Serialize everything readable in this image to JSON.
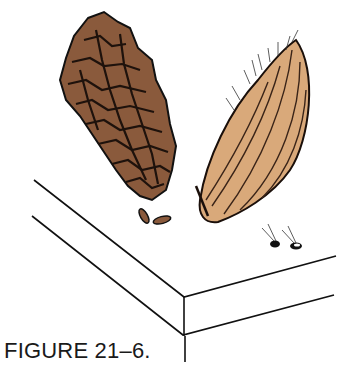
{
  "figure": {
    "caption": "FIGURE 21–6.",
    "subjects": [
      "pine-cone",
      "seed-pod",
      "cone-seeds",
      "pod-seeds",
      "board"
    ]
  },
  "colors": {
    "cone_fill": "#8a5a3c",
    "cone_dark": "#2a1a12",
    "pod_fill": "#d9a97a",
    "pod_line": "#3a2418",
    "outline": "#111111",
    "background": "#ffffff"
  }
}
